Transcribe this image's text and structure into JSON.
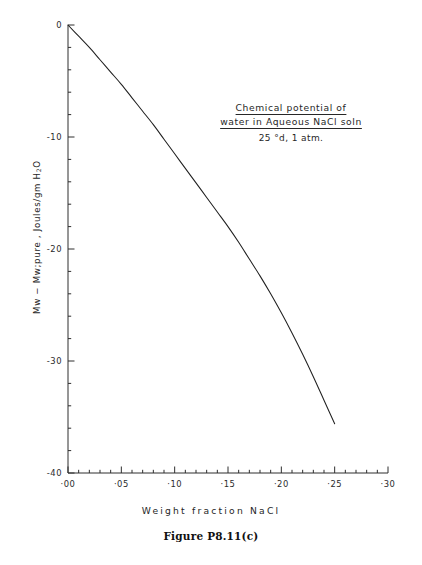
{
  "caption": "Figure P8.11(c)",
  "annotation": {
    "line1": "Chemical potential of",
    "line2": "water in Aqueous NaCl soln",
    "line3": "25 °d, 1 atm."
  },
  "axes": {
    "x_title": "Weight  fraction  NaCl",
    "y_title_prefix": "Μw − Μw;pure ,  Joules/gm H",
    "y_title_sub": "2",
    "y_title_suffix": "O"
  },
  "chart_data": {
    "type": "line",
    "title": "Chemical potential of water in Aqueous NaCl soln",
    "subtitle": "25 °d, 1 atm.",
    "xlabel": "Weight fraction NaCl",
    "ylabel": "Μw − Μw;pure , Joules/gm H2O",
    "xlim": [
      0.0,
      0.3
    ],
    "ylim": [
      -40,
      0
    ],
    "grid": false,
    "legend": null,
    "x_ticks": [
      0.0,
      0.05,
      0.1,
      0.15,
      0.2,
      0.25,
      0.3
    ],
    "x_tick_labels": [
      "·00",
      "·05",
      "·10",
      "·15",
      "·20",
      "·25",
      "·30"
    ],
    "x_minor_step": 0.01,
    "y_ticks": [
      0,
      -10,
      -20,
      -30,
      -40
    ],
    "y_tick_labels": [
      "0",
      "-10",
      "-20",
      "-30",
      "-40"
    ],
    "y_minor_step": 2,
    "series": [
      {
        "name": "Chemical potential of water",
        "x": [
          0.0,
          0.01,
          0.02,
          0.03,
          0.04,
          0.05,
          0.06,
          0.07,
          0.08,
          0.09,
          0.1,
          0.11,
          0.12,
          0.13,
          0.14,
          0.15,
          0.16,
          0.17,
          0.18,
          0.19,
          0.2,
          0.21,
          0.22,
          0.23,
          0.24,
          0.25
        ],
        "y": [
          0.0,
          -1.0,
          -2.0,
          -3.1,
          -4.2,
          -5.3,
          -6.5,
          -7.7,
          -8.9,
          -10.2,
          -11.5,
          -12.8,
          -14.1,
          -15.4,
          -16.7,
          -18.0,
          -19.4,
          -20.9,
          -22.4,
          -24.0,
          -25.7,
          -27.5,
          -29.4,
          -31.4,
          -33.5,
          -35.6
        ]
      }
    ]
  }
}
